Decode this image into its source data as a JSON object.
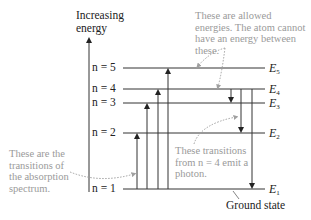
{
  "axis": {
    "title_line1": "Increasing",
    "title_line2": "energy"
  },
  "levels": [
    {
      "n": "n = 5",
      "energy_label": "E",
      "energy_sub": "5",
      "y": 68
    },
    {
      "n": "n = 4",
      "energy_label": "E",
      "energy_sub": "4",
      "y": 89
    },
    {
      "n": "n = 3",
      "energy_label": "E",
      "energy_sub": "3",
      "y": 103
    },
    {
      "n": "n = 2",
      "energy_label": "E",
      "energy_sub": "2",
      "y": 133
    },
    {
      "n": "n = 1",
      "energy_label": "E",
      "energy_sub": "1",
      "y": 189
    }
  ],
  "absorption_transitions": [
    {
      "from": 1,
      "to": 2
    },
    {
      "from": 1,
      "to": 3
    },
    {
      "from": 1,
      "to": 4
    },
    {
      "from": 1,
      "to": 5
    }
  ],
  "emission_transitions": [
    {
      "from": 4,
      "to": 3
    },
    {
      "from": 4,
      "to": 2
    },
    {
      "from": 4,
      "to": 1
    }
  ],
  "annotations": {
    "allowed_energies": "These are allowed energies. The atom cannot have an energy between these.",
    "absorption": "These are the transitions of the absorption spectrum.",
    "emission": "These transitions from n = 4 emit a photon.",
    "ground_state": "Ground state"
  },
  "colors": {
    "line": "#333333",
    "annotation": "#9a9a9a",
    "dotted": "#a0a0a0"
  }
}
